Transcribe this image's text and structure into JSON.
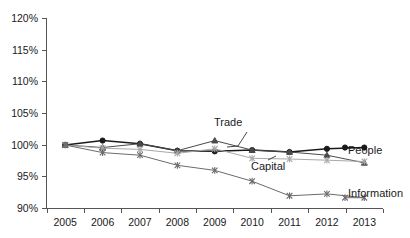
{
  "chart_data": {
    "type": "line",
    "title": "",
    "xlabel": "",
    "ylabel": "",
    "categories": [
      "2005",
      "2006",
      "2007",
      "2008",
      "2009",
      "2010",
      "2011",
      "2012",
      "2013"
    ],
    "x": [
      2005,
      2006,
      2007,
      2008,
      2009,
      2010,
      2011,
      2012,
      2013
    ],
    "ylim": [
      90,
      120
    ],
    "yticks": [
      90,
      95,
      100,
      105,
      110,
      115,
      120
    ],
    "ytick_labels": [
      "90%",
      "95%",
      "100%",
      "105%",
      "110%",
      "115%",
      "120%"
    ],
    "grid": false,
    "legend_position": "right-inline-labels",
    "series": [
      {
        "name": "People",
        "marker": "filled-circle",
        "color": "#1a1a1a",
        "values": [
          100.0,
          100.7,
          100.2,
          99.1,
          99.0,
          99.2,
          98.9,
          99.4,
          99.6
        ]
      },
      {
        "name": "Trade",
        "marker": "filled-triangle",
        "color": "#4a4a4a",
        "values": [
          100.0,
          99.6,
          100.2,
          99.1,
          100.7,
          99.2,
          98.9,
          98.4,
          97.2
        ]
      },
      {
        "name": "Capital",
        "marker": "asterisk",
        "color": "#a8a8a8",
        "values": [
          100.0,
          99.5,
          99.3,
          98.7,
          99.4,
          97.9,
          97.8,
          97.6,
          97.4
        ]
      },
      {
        "name": "Information",
        "marker": "asterisk",
        "color": "#6b6b6b",
        "values": [
          100.0,
          98.8,
          98.4,
          96.8,
          96.0,
          94.3,
          92.0,
          92.3,
          91.7
        ]
      }
    ],
    "annotations": [
      {
        "text": "Trade",
        "points_to_series": "Trade",
        "points_to_x": 2010
      },
      {
        "text": "Capital",
        "points_to_series": "Capital",
        "points_to_x": 2011
      }
    ],
    "end_labels": [
      {
        "text": "People",
        "series": "People"
      },
      {
        "text": "Information",
        "series": "Information"
      }
    ]
  },
  "axes": {
    "y_tick_labels": [
      "120%",
      "115%",
      "110%",
      "105%",
      "100%",
      "95%",
      "90%"
    ],
    "x_tick_labels": [
      "2005",
      "2006",
      "2007",
      "2008",
      "2009",
      "2010",
      "2011",
      "2012",
      "2013"
    ]
  },
  "labels": {
    "trade": "Trade",
    "capital": "Capital",
    "people": "People",
    "information": "Information"
  }
}
